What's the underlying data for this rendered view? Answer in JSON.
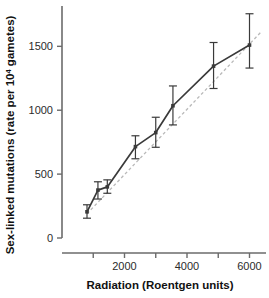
{
  "chart_data": {
    "type": "line",
    "title": "",
    "xlabel": "Radiation (Roentgen units)",
    "ylabel": "Sex-linked mutations (rate per 10⁴ gametes)",
    "ylabel_main": "Sex-linked mutations (rate per 10",
    "ylabel_sup": "4",
    "ylabel_tail": " gametes)",
    "xlim": [
      0,
      6400
    ],
    "ylim": [
      0,
      1800
    ],
    "grid": false,
    "legend": false,
    "x_ticks": [
      1000,
      2000,
      3000,
      4000,
      5000,
      6000
    ],
    "x_tick_labels": [
      "",
      "2000",
      "",
      "4000",
      "",
      "6000"
    ],
    "y_ticks": [
      0,
      500,
      1000,
      1500
    ],
    "y_tick_labels": [
      "0",
      "500",
      "1000",
      "1500"
    ],
    "series": [
      {
        "name": "observed mutation rate",
        "style": "solid-with-markers-and-errorbars",
        "color": "#3a3a3a",
        "x": [
          800,
          1150,
          1450,
          2350,
          3000,
          3550,
          4850,
          6000
        ],
        "y": [
          205,
          375,
          400,
          715,
          825,
          1035,
          1345,
          1510
        ],
        "yerr_low": [
          155,
          305,
          350,
          620,
          710,
          885,
          1170,
          1330
        ],
        "yerr_high": [
          260,
          440,
          455,
          800,
          945,
          1190,
          1530,
          1755
        ]
      },
      {
        "name": "fitted trend line",
        "style": "dashed",
        "color": "#b9b9b9",
        "x": [
          800,
          6400
        ],
        "y": [
          190,
          1620
        ]
      }
    ]
  },
  "axis": {
    "x_axis_color": "#6b6b6b",
    "y_axis_color": "#6b6b6b",
    "tick_color": "#6b6b6b"
  }
}
